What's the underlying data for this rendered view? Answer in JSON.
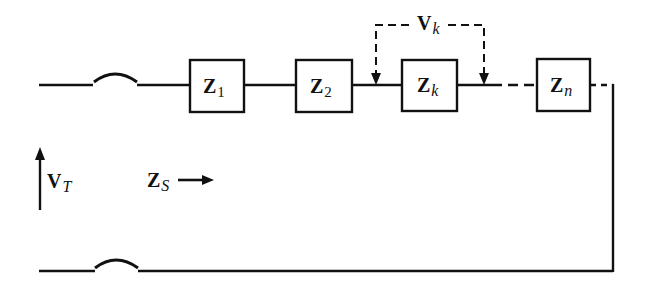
{
  "diagram": {
    "type": "series-circuit",
    "stroke_color": "#111111",
    "background": "#ffffff",
    "impedances": [
      {
        "symbol": "Z",
        "subscript": "1"
      },
      {
        "symbol": "Z",
        "subscript": "2"
      },
      {
        "symbol": "Z",
        "subscript": "k"
      },
      {
        "symbol": "Z",
        "subscript": "n"
      }
    ],
    "voltage_across_k": {
      "symbol": "V",
      "subscript": "k"
    },
    "total_voltage": {
      "symbol": "V",
      "subscript": "T"
    },
    "source_impedance": {
      "symbol": "Z",
      "subscript": "S"
    }
  }
}
